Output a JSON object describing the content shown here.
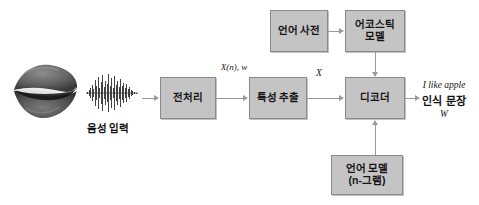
{
  "diagram": {
    "colors": {
      "box_fill": "#c4c4c4",
      "box_border": "#8a8a8a",
      "connector": "#9a9a9a",
      "text": "#151515",
      "background": "#ffffff"
    },
    "nodes": {
      "preprocess": {
        "label": "전처리"
      },
      "feature_extraction": {
        "label": "특성 추출"
      },
      "decoder": {
        "label": "디코더"
      },
      "lexicon": {
        "label": "언어 사전"
      },
      "acoustic_model": {
        "label": "어코스틱\n모델"
      },
      "language_model": {
        "label": "언어 모델\n(n-그램)"
      }
    },
    "input": {
      "mouth_icon": "mouth-lips-icon",
      "waveform_icon": "audio-waveform-icon",
      "label": "음성 입력"
    },
    "edge_labels": {
      "preprocess_to_feature": "X(n),\nw",
      "feature_to_decoder": "X"
    },
    "output": {
      "english": "I like apple",
      "korean": "인식 문장",
      "symbol": "W"
    }
  }
}
